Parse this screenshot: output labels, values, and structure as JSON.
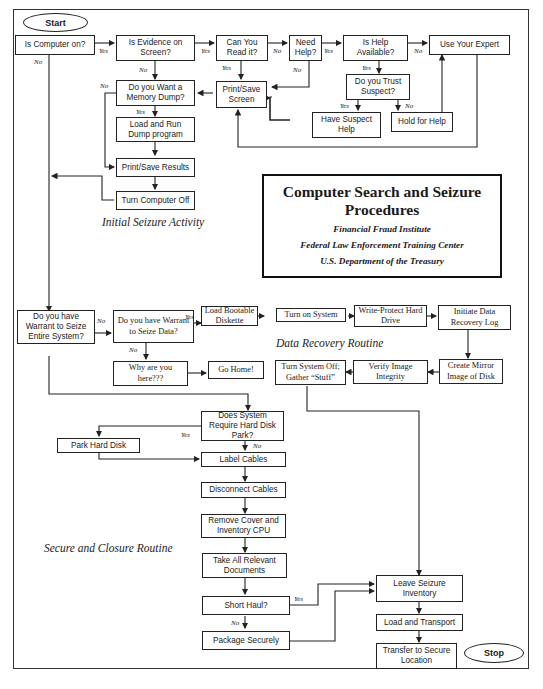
{
  "title": {
    "main": "Computer Search and Seizure Procedures",
    "line1": "Computer Search and Seizure",
    "line2": "Procedures",
    "org1": "Financial Fraud Institute",
    "org2": "Federal Law Enforcement Training Center",
    "org3": "U.S. Department of the Treasury"
  },
  "sections": {
    "initial": "Initial Seizure Activity",
    "recovery": "Data Recovery Routine",
    "closure": "Secure and Closure Routine"
  },
  "terminals": {
    "start": "Start",
    "stop": "Stop"
  },
  "nodes": {
    "computer_on": "Is Computer on?",
    "evidence_on_screen": "Is Evidence on Screen?",
    "can_you_read": "Can You Read it?",
    "need_help": "Need Help?",
    "help_available": "Is Help Available?",
    "use_expert": "Use Your Expert",
    "trust_suspect": "Do you Trust Suspect?",
    "have_suspect_help": "Have Suspect Help",
    "hold_for_help": "Hold for Help",
    "print_save_screen": "Print/Save Screen",
    "memory_dump": "Do you Want a Memory Dump?",
    "load_run_dump": "Load and Run Dump program",
    "print_save_results": "Print/Save Results",
    "turn_computer_off": "Turn Computer Off",
    "warrant_entire": "Do you have Warrant to Seize Entire System?",
    "warrant_data": "Do you have Warrant to Seize Data?",
    "load_bootable": "Load Bootable Diskette",
    "turn_on_system": "Turn on System",
    "write_protect": "Write-Protect Hard Drive",
    "initiate_log": "Initiate Data Recovery Log",
    "create_mirror": "Create Mirror Image of Disk",
    "verify_image": "Verify Image Integrity",
    "turn_system_off": "Turn System Off; Gather “Stuff”",
    "why_here": "Why are you here???",
    "go_home": "Go Home!",
    "require_park": "Does System Require Hard Disk Park?",
    "park_disk": "Park Hard Disk",
    "label_cables": "Label Cables",
    "disconnect_cables": "Disconnect Cables",
    "remove_cover": "Remove Cover and Inventory CPU",
    "take_documents": "Take All Relevant Documents",
    "short_haul": "Short Haul?",
    "package_securely": "Package Securely",
    "leave_inventory": "Leave Seizure Inventory",
    "load_transport": "Load and Transport",
    "transfer_secure": "Transfer to Secure Location"
  },
  "edge_labels": {
    "yes": "Yes",
    "no": "No"
  }
}
